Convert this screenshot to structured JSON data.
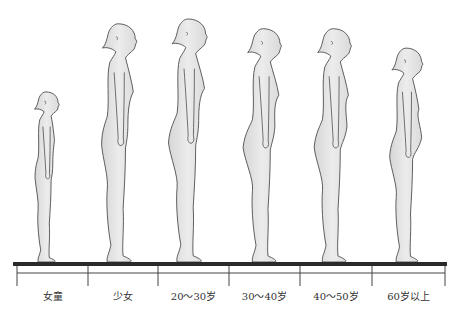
{
  "diagram": {
    "title": "",
    "stages": [
      {
        "label": "女童",
        "relative_height": 0.7,
        "bust": 0.0,
        "belly": 0.0,
        "hip": 0.15
      },
      {
        "label": "少女",
        "relative_height": 0.98,
        "bust": 0.35,
        "belly": 0.0,
        "hip": 0.3
      },
      {
        "label": "20～30岁",
        "relative_height": 1.0,
        "bust": 0.45,
        "belly": 0.05,
        "hip": 0.55
      },
      {
        "label": "30～40岁",
        "relative_height": 0.96,
        "bust": 0.45,
        "belly": 0.2,
        "hip": 0.65
      },
      {
        "label": "40～50岁",
        "relative_height": 0.96,
        "bust": 0.4,
        "belly": 0.4,
        "hip": 0.55
      },
      {
        "label": "60岁以上",
        "relative_height": 0.88,
        "bust": 0.25,
        "belly": 0.7,
        "hip": 0.45
      }
    ],
    "colors": {
      "figure_fill": "#e2e2e2",
      "figure_stroke": "#3a3a3a",
      "ground": "#2a2a2a",
      "scale": "#444444",
      "label_text": "#333333"
    }
  }
}
